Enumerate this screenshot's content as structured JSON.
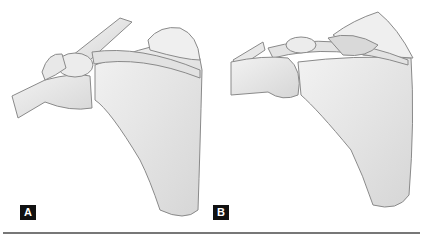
{
  "figure": {
    "panels": [
      {
        "id": "A",
        "label": "A",
        "subject": "scapula with clavicle and humerus (anterior view)"
      },
      {
        "id": "B",
        "label": "B",
        "subject": "scapula with clavicle and humerus, acromion region variant"
      }
    ],
    "colors": {
      "bone_fill": "#e9e9e9",
      "bone_shade": "#cfcfcf",
      "outline": "#8a8a8a",
      "label_bg": "#111111",
      "label_text": "#ffffff",
      "rule": "#777777"
    }
  }
}
